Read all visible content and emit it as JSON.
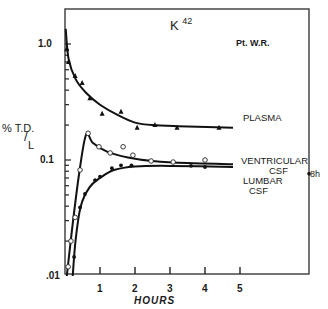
{
  "chart_data": {
    "type": "line",
    "title": "K 42",
    "title_base": "K",
    "title_sup": "42",
    "subtitle": "Pt. W.R.",
    "xlabel": "HOURS",
    "ylabel": "% T.D./L",
    "ylabel_parts": [
      "% T.D.",
      "L"
    ],
    "yscale": "log",
    "ylim": [
      0.01,
      1.4
    ],
    "xlim": [
      0,
      7
    ],
    "x_ticks": [
      "1",
      "2",
      "3",
      "4",
      "5"
    ],
    "y_ticks": [
      "1.0",
      "0.1",
      ".01"
    ],
    "grid": false,
    "legend": "inline labels at right",
    "series": [
      {
        "name": "PLASMA",
        "marker": "triangle",
        "points": [
          [
            0.05,
            0.9
          ],
          [
            0.1,
            0.7
          ],
          [
            0.29,
            0.53
          ],
          [
            0.49,
            0.46
          ],
          [
            0.71,
            0.34
          ],
          [
            1.06,
            0.25
          ],
          [
            1.6,
            0.26
          ],
          [
            2.06,
            0.19
          ],
          [
            2.57,
            0.2
          ],
          [
            3.2,
            0.19
          ],
          [
            4.4,
            0.19
          ]
        ],
        "curve": [
          [
            0.02,
            1.35
          ],
          [
            0.1,
            0.75
          ],
          [
            0.3,
            0.5
          ],
          [
            0.6,
            0.38
          ],
          [
            1.0,
            0.3
          ],
          [
            1.5,
            0.245
          ],
          [
            2.0,
            0.21
          ],
          [
            2.5,
            0.2
          ],
          [
            3.5,
            0.195
          ],
          [
            4.8,
            0.19
          ]
        ]
      },
      {
        "name": "VENTRICULAR CSF",
        "label_lines": [
          "VENTRICULAR",
          "CSF"
        ],
        "marker": "open-circle",
        "points": [
          [
            0.09,
            0.012
          ],
          [
            0.17,
            0.02
          ],
          [
            0.29,
            0.032
          ],
          [
            0.43,
            0.082
          ],
          [
            0.66,
            0.17
          ],
          [
            0.97,
            0.13
          ],
          [
            1.29,
            0.115
          ],
          [
            1.66,
            0.13
          ],
          [
            1.94,
            0.11
          ],
          [
            2.46,
            0.098
          ],
          [
            3.09,
            0.096
          ],
          [
            4.0,
            0.1
          ]
        ],
        "curve": [
          [
            0.05,
            0.01
          ],
          [
            0.2,
            0.025
          ],
          [
            0.4,
            0.075
          ],
          [
            0.6,
            0.165
          ],
          [
            0.8,
            0.14
          ],
          [
            1.2,
            0.118
          ],
          [
            1.8,
            0.105
          ],
          [
            2.5,
            0.098
          ],
          [
            3.5,
            0.094
          ],
          [
            4.8,
            0.092
          ]
        ]
      },
      {
        "name": "LUMBAR CSF",
        "label_lines": [
          "LUMBAR",
          "CSF"
        ],
        "marker": "filled-circle",
        "points": [
          [
            0.26,
            0.0146
          ],
          [
            0.43,
            0.039
          ],
          [
            0.57,
            0.051
          ],
          [
            0.86,
            0.067
          ],
          [
            1.0,
            0.072
          ],
          [
            1.34,
            0.085
          ],
          [
            1.6,
            0.09
          ],
          [
            1.9,
            0.09
          ],
          [
            3.6,
            0.089
          ],
          [
            4.0,
            0.087
          ]
        ],
        "curve": [
          [
            0.22,
            0.01
          ],
          [
            0.3,
            0.02
          ],
          [
            0.45,
            0.04
          ],
          [
            0.7,
            0.058
          ],
          [
            1.0,
            0.07
          ],
          [
            1.4,
            0.082
          ],
          [
            2.0,
            0.088
          ],
          [
            3.0,
            0.089
          ],
          [
            4.8,
            0.087
          ]
        ]
      }
    ],
    "annotations": [
      {
        "text": "8h",
        "x": 8,
        "y": 0.076,
        "note": "lumbar CSF value at 8 hours, plotted on right frame edge"
      }
    ]
  }
}
